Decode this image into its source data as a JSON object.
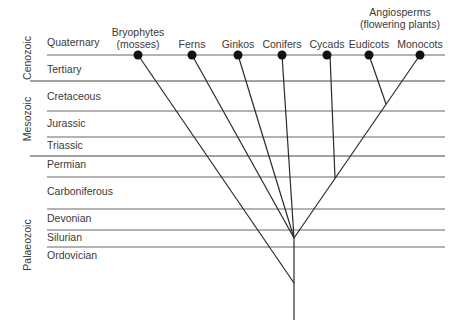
{
  "diagram": {
    "type": "phylogenetic tree over geologic time",
    "eras": [
      {
        "label": "Cenozoic"
      },
      {
        "label": "Mesozoic"
      },
      {
        "label": "Palaeozoic"
      }
    ],
    "periods": [
      {
        "label": "Quaternary"
      },
      {
        "label": "Tertiary"
      },
      {
        "label": "Cretaceous"
      },
      {
        "label": "Jurassic"
      },
      {
        "label": "Triassic"
      },
      {
        "label": "Permian"
      },
      {
        "label": "Carboniferous"
      },
      {
        "label": "Devonian"
      },
      {
        "label": "Silurian"
      },
      {
        "label": "Ordovician"
      }
    ],
    "group_label": {
      "line1": "Angiosperms",
      "line2": "(flowering plants)"
    },
    "taxa": [
      {
        "line1": "Bryophytes",
        "line2": "(mosses)"
      },
      {
        "line1": "Ferns"
      },
      {
        "line1": "Ginkos"
      },
      {
        "line1": "Conifers"
      },
      {
        "line1": "Cycads"
      },
      {
        "line1": "Eudicots"
      },
      {
        "line1": "Monocots"
      }
    ],
    "colors": {
      "line": "#333333",
      "divider": "#555555",
      "node": "#111111"
    }
  }
}
